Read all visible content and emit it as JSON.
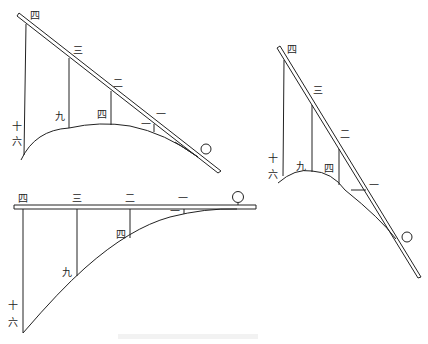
{
  "diagrams": [
    {
      "id": "incline-left",
      "rod_labels": [
        "四",
        "三",
        "二",
        "一"
      ],
      "curve_labels": [
        "十六",
        "九",
        "四",
        "一"
      ],
      "origin_marker": "〇"
    },
    {
      "id": "incline-right",
      "rod_labels": [
        "四",
        "三",
        "二",
        "一"
      ],
      "curve_labels": [
        "十六",
        "九",
        "四"
      ],
      "origin_marker": "〇"
    },
    {
      "id": "horizontal",
      "rod_labels": [
        "四",
        "三",
        "二",
        "一"
      ],
      "curve_labels": [
        "十六",
        "九",
        "四",
        "一"
      ],
      "origin_marker": "〇"
    }
  ],
  "colors": {
    "stroke": "#222222",
    "background": "#ffffff"
  }
}
